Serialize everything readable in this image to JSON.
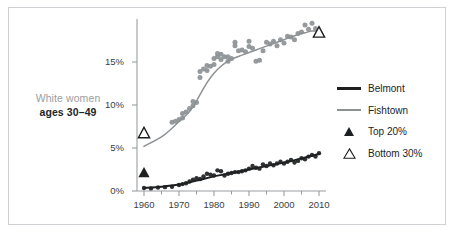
{
  "figure": {
    "side_label_line1": "White women",
    "side_label_line2": "ages 30–49",
    "border_color": "#cfd2d4",
    "background": "#ffffff"
  },
  "legend": {
    "position": "right",
    "items": [
      {
        "label": "Belmont",
        "key": "line-dark",
        "color": "#1d1f21"
      },
      {
        "label": "Fishtown",
        "key": "line-gray",
        "color": "#8d9194"
      },
      {
        "label": "Top 20%",
        "key": "triangle-filled",
        "color": "#1d1f21"
      },
      {
        "label": "Bottom 30%",
        "key": "triangle-hollow",
        "color": "#1d1f21"
      }
    ]
  },
  "chart_data": {
    "type": "scatter",
    "title": "",
    "subtitle": "",
    "xlabel": "",
    "ylabel": "",
    "xlim": [
      1958,
      2012
    ],
    "ylim": [
      0,
      20
    ],
    "grid": false,
    "legend_position": "right",
    "yticks": [
      0,
      5,
      10,
      15
    ],
    "ytick_labels": [
      "0%",
      "5%",
      "10%",
      "15%"
    ],
    "xticks": [
      1960,
      1970,
      1980,
      1990,
      2000,
      2010
    ],
    "xtick_labels": [
      "1960",
      "1970",
      "1980",
      "1990",
      "2000",
      "2010"
    ],
    "xminor_ticks": [
      1965,
      1975,
      1985,
      1995,
      2005
    ],
    "series": [
      {
        "name": "Fishtown",
        "role": "trend-line",
        "color": "#8d9194",
        "x": [
          1960,
          1965,
          1968,
          1970,
          1972,
          1974,
          1976,
          1978,
          1980,
          1982,
          1984,
          1986,
          1988,
          1990,
          1992,
          1994,
          1996,
          1998,
          2000,
          2002,
          2004,
          2006,
          2008,
          2010
        ],
        "y": [
          5.2,
          6.3,
          7.3,
          8.1,
          8.8,
          9.8,
          11.2,
          12.6,
          13.7,
          14.5,
          15.1,
          15.5,
          15.8,
          16.1,
          16.4,
          16.7,
          17.0,
          17.3,
          17.6,
          17.9,
          18.2,
          18.4,
          18.6,
          18.6
        ]
      },
      {
        "name": "Fishtown",
        "role": "scatter",
        "color": "#8d9194",
        "x": [
          1968,
          1969,
          1970,
          1971,
          1971,
          1972,
          1973,
          1974,
          1974,
          1975,
          1976,
          1976,
          1977,
          1978,
          1978,
          1979,
          1980,
          1980,
          1981,
          1981,
          1982,
          1982,
          1983,
          1984,
          1984,
          1985,
          1986,
          1986,
          1987,
          1988,
          1989,
          1990,
          1990,
          1991,
          1992,
          1993,
          1994,
          1995,
          1996,
          1997,
          1998,
          1999,
          2000,
          2001,
          2002,
          2003,
          2004,
          2005,
          2006,
          2007,
          2008,
          2009
        ],
        "y": [
          8.0,
          8.1,
          8.3,
          8.5,
          9.0,
          9.2,
          9.6,
          9.9,
          10.4,
          10.3,
          13.2,
          13.9,
          14.2,
          14.0,
          14.6,
          14.5,
          14.7,
          15.4,
          15.6,
          16.0,
          15.3,
          15.9,
          15.6,
          15.1,
          15.6,
          15.4,
          16.9,
          17.3,
          16.3,
          16.4,
          16.2,
          16.8,
          17.4,
          16.6,
          15.1,
          15.2,
          16.3,
          17.3,
          17.1,
          17.4,
          16.9,
          17.6,
          17.2,
          18.0,
          17.9,
          17.6,
          18.3,
          18.5,
          19.3,
          18.8,
          19.5,
          18.9
        ]
      },
      {
        "name": "Belmont",
        "role": "trend-line",
        "color": "#1d1f21",
        "x": [
          1960,
          1965,
          1970,
          1975,
          1980,
          1985,
          1990,
          1995,
          2000,
          2005,
          2010
        ],
        "y": [
          0.35,
          0.5,
          0.75,
          1.2,
          1.7,
          2.1,
          2.5,
          2.9,
          3.3,
          3.8,
          4.3
        ]
      },
      {
        "name": "Belmont",
        "role": "scatter",
        "color": "#1d1f21",
        "x": [
          1960,
          1962,
          1964,
          1966,
          1968,
          1970,
          1971,
          1972,
          1973,
          1974,
          1975,
          1976,
          1977,
          1978,
          1979,
          1980,
          1981,
          1982,
          1983,
          1984,
          1985,
          1986,
          1987,
          1988,
          1989,
          1990,
          1991,
          1992,
          1993,
          1994,
          1995,
          1996,
          1997,
          1998,
          1999,
          2000,
          2001,
          2002,
          2003,
          2004,
          2005,
          2006,
          2007,
          2008,
          2009,
          2010
        ],
        "y": [
          0.35,
          0.3,
          0.4,
          0.45,
          0.5,
          0.7,
          0.8,
          0.9,
          1.1,
          1.3,
          1.5,
          1.4,
          1.7,
          2.0,
          1.9,
          1.8,
          2.4,
          2.3,
          1.8,
          2.0,
          2.1,
          2.2,
          2.2,
          2.3,
          2.4,
          2.6,
          2.9,
          2.7,
          2.6,
          3.1,
          2.9,
          3.2,
          3.0,
          3.2,
          3.4,
          3.2,
          3.4,
          3.6,
          3.3,
          3.5,
          3.8,
          3.7,
          4.0,
          4.2,
          4.0,
          4.4
        ]
      },
      {
        "name": "Top 20%",
        "role": "marker-triangle-filled",
        "color": "#1d1f21",
        "x": [
          1960
        ],
        "y": [
          2.2
        ]
      },
      {
        "name": "Bottom 30%",
        "role": "marker-triangle-hollow",
        "color": "#1d1f21",
        "x": [
          1960,
          2010
        ],
        "y": [
          6.8,
          18.5
        ]
      }
    ]
  }
}
